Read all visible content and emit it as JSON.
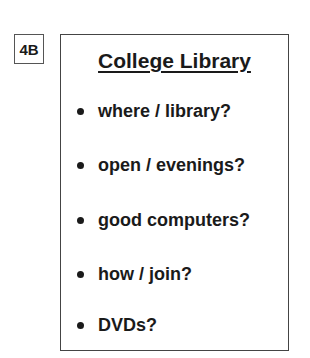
{
  "label": "4B",
  "card": {
    "title": "College Library",
    "items": [
      "where / library?",
      "open / evenings?",
      "good computers?",
      "how / join?",
      "DVDs?"
    ]
  }
}
